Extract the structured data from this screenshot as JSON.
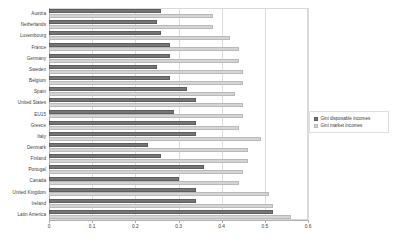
{
  "chart_data": {
    "type": "bar",
    "orientation": "horizontal",
    "title": "",
    "xlabel": "",
    "ylabel": "",
    "xlim": [
      0,
      0.6
    ],
    "xticks": [
      "0",
      "0.1",
      "0.2",
      "0.3",
      "0.4",
      "0.5",
      "0.6"
    ],
    "xtick_values": [
      0,
      0.1,
      0.2,
      0.3,
      0.4,
      0.5,
      0.6
    ],
    "grid": true,
    "legend_position": "right",
    "categories": [
      "Austria",
      "Netherlands",
      "Luxembourg",
      "France",
      "Germany",
      "Sweden",
      "Belgium",
      "Spain",
      "United States",
      "EU15",
      "Greece",
      "Italy",
      "Denmark",
      "Finland",
      "Portugal",
      "Canada",
      "United Kingdom",
      "Ireland",
      "Latin America"
    ],
    "series": [
      {
        "name": "Gini disposable incomes",
        "color": "#767676",
        "values": [
          0.26,
          0.25,
          0.26,
          0.28,
          0.28,
          0.25,
          0.28,
          0.32,
          0.34,
          0.29,
          0.34,
          0.34,
          0.23,
          0.26,
          0.36,
          0.3,
          0.34,
          0.34,
          0.52
        ]
      },
      {
        "name": "Gini market incomes",
        "color": "#d4d4d4",
        "values": [
          0.38,
          0.38,
          0.42,
          0.44,
          0.44,
          0.45,
          0.45,
          0.43,
          0.45,
          0.45,
          0.44,
          0.49,
          0.46,
          0.46,
          0.45,
          0.44,
          0.51,
          0.52,
          0.56
        ]
      }
    ]
  },
  "legend": {
    "items": [
      {
        "label": "Gini disposable incomes",
        "swatch": "disposable"
      },
      {
        "label": "Gini market incomes",
        "swatch": "market"
      }
    ]
  }
}
